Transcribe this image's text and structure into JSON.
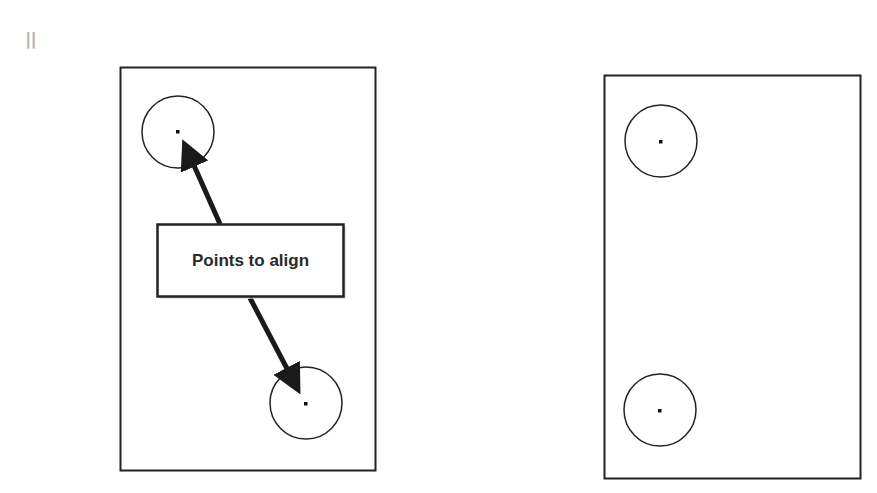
{
  "diagram": {
    "label": "Points to align",
    "corner_mark": "ꟾᶾ",
    "colors": {
      "stroke": "#222222",
      "background": "#ffffff"
    },
    "left_panel": {
      "rect": [
        120,
        67,
        255,
        403
      ],
      "circles": [
        {
          "cx": 178,
          "cy": 132,
          "r": 36
        },
        {
          "cx": 306,
          "cy": 403,
          "r": 36
        }
      ],
      "arrows": [
        "label-to-top-point",
        "label-to-bottom-point"
      ]
    },
    "right_panel": {
      "rect": [
        604,
        75,
        256,
        403
      ],
      "circles": [
        {
          "cx": 661,
          "cy": 141,
          "r": 36
        },
        {
          "cx": 660,
          "cy": 410,
          "r": 36
        }
      ]
    }
  }
}
